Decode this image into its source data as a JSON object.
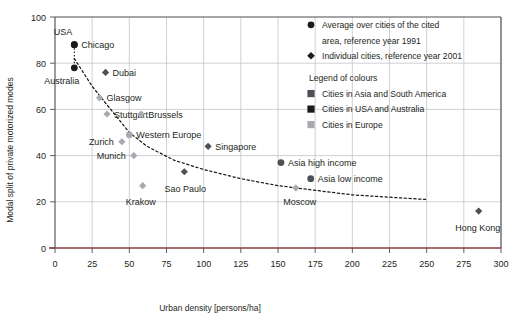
{
  "chart_data": {
    "type": "scatter",
    "title": "",
    "xlabel": "Urban density [persons/ha]",
    "ylabel": "Modal split of private motorized modes",
    "xlim": [
      0,
      300
    ],
    "ylim": [
      0,
      100
    ],
    "xticks": [
      0,
      25,
      50,
      75,
      100,
      125,
      150,
      175,
      200,
      225,
      250,
      275,
      300
    ],
    "yticks": [
      0,
      20,
      40,
      60,
      80,
      100
    ],
    "grid": true,
    "legend_position": "top-right inside plot",
    "points": [
      {
        "label": "USA",
        "x": 13,
        "y": 88,
        "marker": "circle",
        "colour_group": "usa-australia",
        "label_pos": "above-left"
      },
      {
        "label": "Chicago",
        "x": 13,
        "y": 88,
        "marker": "circle",
        "colour_group": "usa-australia",
        "label_pos": "right"
      },
      {
        "label": "Australia",
        "x": 13,
        "y": 78,
        "marker": "circle",
        "colour_group": "usa-australia",
        "label_pos": "below-left"
      },
      {
        "label": "Dubai",
        "x": 34,
        "y": 76,
        "marker": "diamond",
        "colour_group": "asia-south-america",
        "label_pos": "right"
      },
      {
        "label": "Glasgow",
        "x": 30,
        "y": 65,
        "marker": "diamond",
        "colour_group": "europe",
        "label_pos": "right"
      },
      {
        "label": "Stuttgart",
        "x": 35,
        "y": 58,
        "marker": "diamond",
        "colour_group": "europe",
        "label_pos": "right"
      },
      {
        "label": "Brussels",
        "x": 58,
        "y": 58,
        "marker": "diamond",
        "colour_group": "europe",
        "label_pos": "right"
      },
      {
        "label": "Western Europe",
        "x": 50,
        "y": 49,
        "marker": "circle",
        "colour_group": "europe",
        "label_pos": "right"
      },
      {
        "label": "Zurich",
        "x": 45,
        "y": 46,
        "marker": "diamond",
        "colour_group": "europe",
        "label_pos": "left"
      },
      {
        "label": "Munich",
        "x": 53,
        "y": 40,
        "marker": "diamond",
        "colour_group": "europe",
        "label_pos": "left"
      },
      {
        "label": "Krakow",
        "x": 59,
        "y": 27,
        "marker": "diamond",
        "colour_group": "europe",
        "label_pos": "below"
      },
      {
        "label": "Sao Paulo",
        "x": 87,
        "y": 33,
        "marker": "diamond",
        "colour_group": "asia-south-america",
        "label_pos": "below"
      },
      {
        "label": "Singapore",
        "x": 103,
        "y": 44,
        "marker": "diamond",
        "colour_group": "asia-south-america",
        "label_pos": "right"
      },
      {
        "label": "Asia high income",
        "x": 152,
        "y": 37,
        "marker": "circle",
        "colour_group": "asia-south-america",
        "label_pos": "right"
      },
      {
        "label": "Asia low income",
        "x": 172,
        "y": 30,
        "marker": "circle",
        "colour_group": "asia-south-america",
        "label_pos": "right"
      },
      {
        "label": "Moscow",
        "x": 162,
        "y": 26,
        "marker": "diamond",
        "colour_group": "europe",
        "label_pos": "below"
      },
      {
        "label": "Hong Kong",
        "x": 285,
        "y": 16,
        "marker": "diamond",
        "colour_group": "asia-south-america",
        "label_pos": "below"
      }
    ],
    "trend_line": {
      "style": "dotted",
      "description": "declining dotted trend curve",
      "points": [
        [
          13,
          82
        ],
        [
          25,
          70
        ],
        [
          35,
          62
        ],
        [
          50,
          50
        ],
        [
          62,
          44
        ],
        [
          80,
          38
        ],
        [
          100,
          34
        ],
        [
          125,
          30
        ],
        [
          150,
          27
        ],
        [
          175,
          25
        ],
        [
          200,
          23
        ],
        [
          225,
          22
        ],
        [
          250,
          21
        ]
      ]
    },
    "legend": {
      "marker_entries": [
        {
          "marker": "circle",
          "text_line1": "Average over cities of the cited",
          "text_line2": "area, reference year 1991"
        },
        {
          "marker": "diamond",
          "text_line1": "Individual cities, reference year 2001",
          "text_line2": ""
        }
      ],
      "colour_title": "Legend of colours",
      "colour_entries": [
        {
          "swatch": "square",
          "label": "Cities in Asia and South America",
          "colour": "#4d5055"
        },
        {
          "swatch": "square",
          "label": "Cities in USA and Australia",
          "colour": "#1a1a1a"
        },
        {
          "swatch": "square",
          "label": "Cities in Europe",
          "colour": "#a7aaae"
        }
      ]
    },
    "colours": {
      "asia-south-america": "#4d5055",
      "usa-australia": "#1a1a1a",
      "europe": "#a7aaae",
      "grid": "#b9bfc6",
      "frame": "#4c4c52",
      "baseline": "#8a3b3f"
    }
  }
}
